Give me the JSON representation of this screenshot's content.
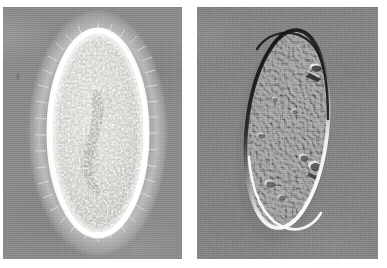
{
  "figure": {
    "kind": "two-panel-light-micrograph-comparison",
    "background_color": "#ffffff",
    "width": 387,
    "height": 268,
    "panels": [
      {
        "id": "left",
        "name": "phase-contrast-micrograph",
        "technique": "phase contrast",
        "subject": "ciliate protozoan (Paramecium-like)",
        "x": 3,
        "y": 7,
        "width": 179,
        "height": 252,
        "background_color": "#8b8b8b",
        "cell": {
          "shape": "ellipse",
          "center_x": 95,
          "center_y": 133,
          "radius_x": 49,
          "radius_y": 103,
          "halo_color": "#fbfbf8",
          "cytoplasm_color": "#cfcfcb",
          "granular": true,
          "cilia_visible": true,
          "nucleus_color": "#9d9d99"
        }
      },
      {
        "id": "right",
        "name": "dic-micrograph",
        "technique": "differential interference contrast",
        "subject": "ciliate protozoan (Paramecium-like)",
        "x": 197,
        "y": 7,
        "width": 181,
        "height": 252,
        "background_color": "#878787",
        "cell": {
          "shape": "ellipse",
          "center_x": 96,
          "center_y": 128,
          "radius_x": 42,
          "radius_y": 103,
          "rotation_deg": 6,
          "shadow_edge": "#1d1d1d",
          "highlight_edge": "#fdfdfb",
          "cytoplasm_color": "#8f8f8f",
          "relief_direction": "upper-left",
          "granular": true
        }
      }
    ],
    "artifacts": [
      {
        "name": "dust-speck-left-margin",
        "panel": "left",
        "x": 14,
        "y": 66,
        "width": 2,
        "height": 7
      }
    ]
  }
}
